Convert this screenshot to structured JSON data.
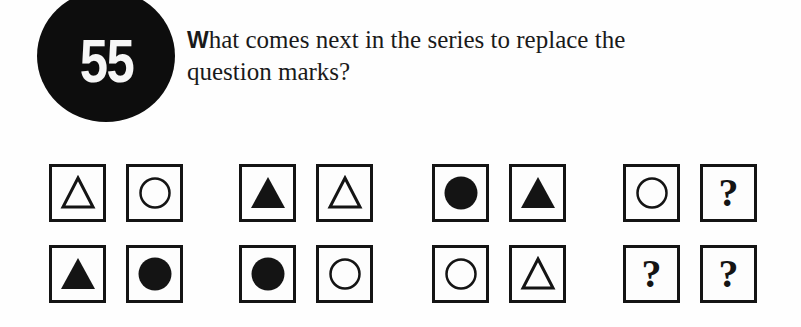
{
  "badge": {
    "number": "55"
  },
  "question": {
    "first_letter": "W",
    "text_rest": "hat comes next in the series to replace the",
    "line2": "question marks?"
  },
  "colors": {
    "ink": "#141414",
    "badge_bg": "#0d0d0d",
    "badge_text": "#f6f6f6",
    "page": "#fefefe"
  },
  "groups": [
    {
      "cells": [
        {
          "shape": "triangle-outline"
        },
        {
          "shape": "circle-outline"
        },
        {
          "shape": "triangle-filled"
        },
        {
          "shape": "circle-filled"
        }
      ]
    },
    {
      "cells": [
        {
          "shape": "triangle-filled"
        },
        {
          "shape": "triangle-outline"
        },
        {
          "shape": "circle-filled"
        },
        {
          "shape": "circle-outline"
        }
      ]
    },
    {
      "cells": [
        {
          "shape": "circle-filled"
        },
        {
          "shape": "triangle-filled"
        },
        {
          "shape": "circle-outline"
        },
        {
          "shape": "triangle-outline"
        }
      ]
    },
    {
      "cells": [
        {
          "shape": "circle-outline"
        },
        {
          "shape": "question",
          "label": "?"
        },
        {
          "shape": "question",
          "label": "?"
        },
        {
          "shape": "question",
          "label": "?"
        }
      ]
    }
  ]
}
